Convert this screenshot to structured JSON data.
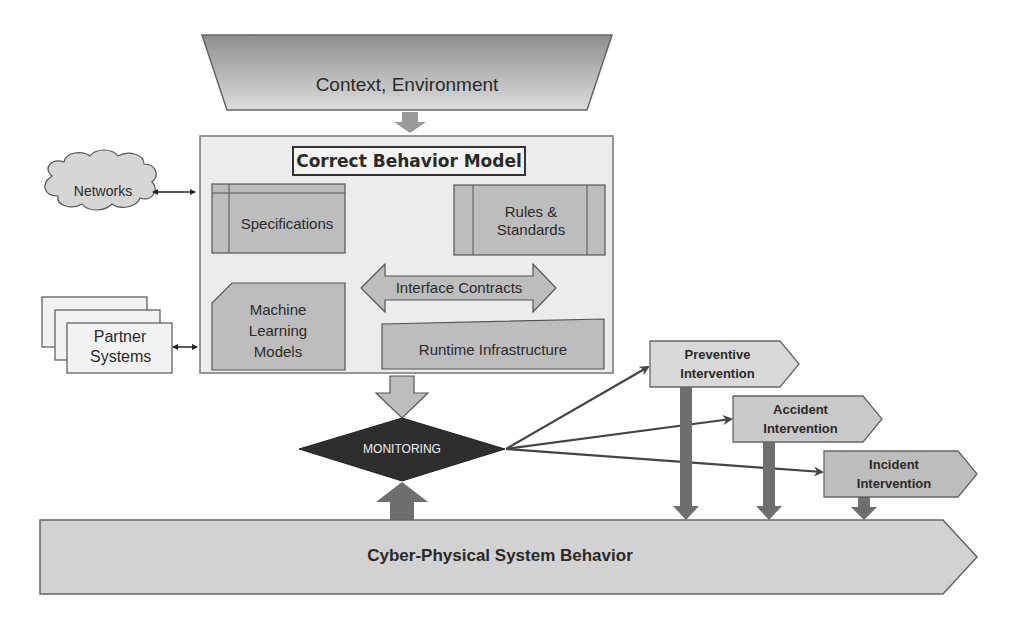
{
  "diagram": {
    "context": {
      "label": "Context, Environment"
    },
    "correct_behavior_model": {
      "title": "Correct Behavior Model",
      "components": {
        "specifications": "Specifications",
        "rules_standards": "Rules & Standards",
        "interface_contracts": "Interface Contracts",
        "ml_models": "Machine Learning Models",
        "runtime_infrastructure": "Runtime Infrastructure"
      }
    },
    "external": {
      "networks": "Networks",
      "partner_systems": "Partner Systems"
    },
    "monitoring": {
      "label": "MONITORING"
    },
    "interventions": [
      {
        "label": "Preventive Intervention"
      },
      {
        "label": "Accident Intervention"
      },
      {
        "label": "Incident Intervention"
      }
    ],
    "system": {
      "label": "Cyber-Physical System Behavior"
    },
    "colors": {
      "shape_fill": "#bdbdbd",
      "panel_fill": "#ececec",
      "monitor_fill": "#2e2e2e",
      "arrow_dark": "#6e6e6e",
      "stroke": "#555555"
    }
  }
}
